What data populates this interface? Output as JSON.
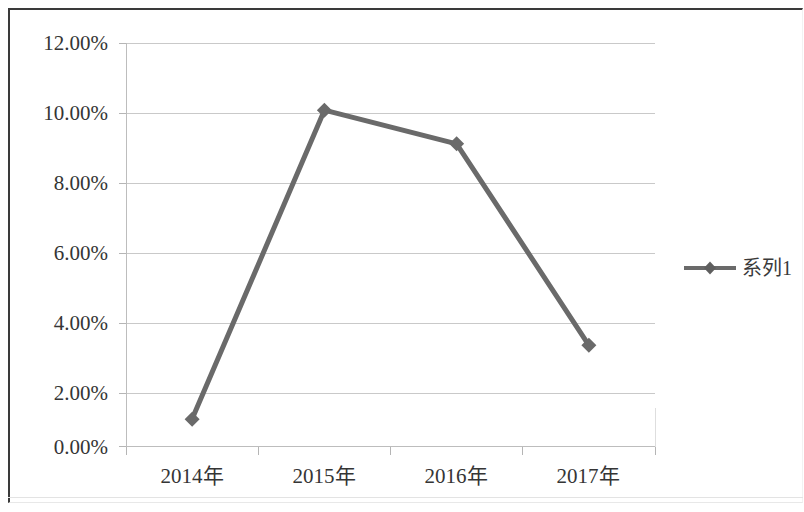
{
  "chart_data": {
    "type": "line",
    "title": "",
    "xlabel": "",
    "ylabel": "",
    "categories": [
      "2014年",
      "2015年",
      "2016年",
      "2017年"
    ],
    "series": [
      {
        "name": "系列1",
        "values": [
          0.008,
          0.1,
          0.09,
          0.03
        ],
        "values_percent": [
          "0.80%",
          "10.00%",
          "9.00%",
          "3.00%"
        ],
        "color": "#6a6a6a",
        "marker": "diamond"
      }
    ],
    "ylim": [
      0,
      0.12
    ],
    "y_ticks": [
      "0.00%",
      "2.00%",
      "4.00%",
      "6.00%",
      "8.00%",
      "10.00%",
      "12.00%"
    ],
    "y_tick_values": [
      0,
      0.02,
      0.04,
      0.06,
      0.08,
      0.1,
      0.12
    ],
    "grid": true,
    "legend_position": "right"
  },
  "legend": {
    "entries": [
      {
        "label": "系列1",
        "marker": "diamond-line-marker",
        "color": "#6a6a6a"
      }
    ]
  },
  "axes": {
    "y_tick_labels": [
      "12.00%",
      "10.00%",
      "8.00%",
      "6.00%",
      "4.00%",
      "2.00%",
      "0.00%"
    ],
    "x_tick_labels": [
      "2014年",
      "2015年",
      "2016年",
      "2017年"
    ]
  },
  "colors": {
    "series": "#6a6a6a",
    "gridline": "#c9c9c9",
    "axis": "#bdbdbd",
    "text": "#353535",
    "frame": "#3a3a3a",
    "background": "#ffffff"
  }
}
